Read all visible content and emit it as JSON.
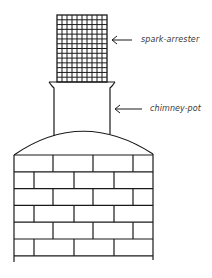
{
  "diagram": {
    "stroke_color": "#1a1a1a",
    "background": "#ffffff",
    "labels": [
      {
        "id": "spark-arrester",
        "text": "spark-arrester",
        "arrow": "left-arrow"
      },
      {
        "id": "chimney-pot",
        "text": "chimney-pot",
        "arrow": "left-arrow"
      }
    ],
    "parts": {
      "spark_arrester": {
        "shape": "mesh-grid",
        "columns": 10,
        "rows": 14
      },
      "chimney_pot": {
        "shape": "flared-cylinder"
      },
      "dome": {
        "shape": "arc"
      },
      "brick_stack": {
        "rows": 6,
        "bond": "running"
      }
    }
  }
}
